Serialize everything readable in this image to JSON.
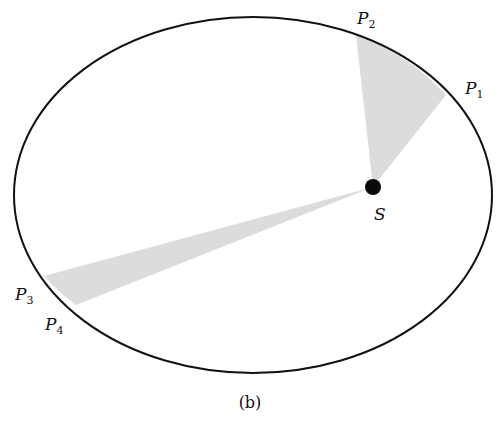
{
  "diagram": {
    "caption": "(b)",
    "colors": {
      "orbit": "#111111",
      "sector_fill": "#dcdcdc",
      "sun": "#0a0a0a",
      "background": "#ffffff"
    },
    "orbit": {
      "cx": 253,
      "cy": 195,
      "rx": 239,
      "ry": 178
    },
    "focus": {
      "label": "S",
      "x": 373,
      "y": 187,
      "r": 8
    },
    "points": [
      {
        "id": "P1",
        "base": "P",
        "sub": "1",
        "x": 446,
        "y": 95
      },
      {
        "id": "P2",
        "base": "P",
        "sub": "2",
        "x": 356,
        "y": 35
      },
      {
        "id": "P3",
        "base": "P",
        "sub": "3",
        "x": 44,
        "y": 276
      },
      {
        "id": "P4",
        "base": "P",
        "sub": "4",
        "x": 76,
        "y": 305
      }
    ],
    "sectors": [
      {
        "from": "P1",
        "to": "P2",
        "note": "short-radius wide sector near S"
      },
      {
        "from": "P3",
        "to": "P4",
        "note": "long-radius narrow sector far from S"
      }
    ],
    "labels": {
      "p1": {
        "base": "P",
        "sub": "1"
      },
      "p2": {
        "base": "P",
        "sub": "2"
      },
      "p3": {
        "base": "P",
        "sub": "3"
      },
      "p4": {
        "base": "P",
        "sub": "4"
      },
      "s": "S"
    }
  }
}
